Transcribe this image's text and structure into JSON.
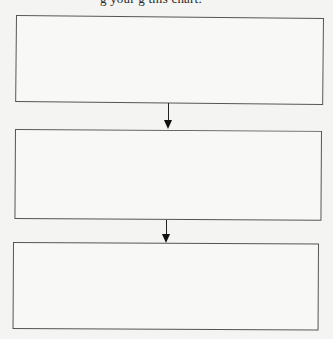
{
  "caption": {
    "text": "g your     g     this chart."
  },
  "flowchart": {
    "direction": "top-to-bottom",
    "boxes": [
      {
        "id": "step-1",
        "text": ""
      },
      {
        "id": "step-2",
        "text": ""
      },
      {
        "id": "step-3",
        "text": ""
      }
    ],
    "arrows": [
      {
        "from": "step-1",
        "to": "step-2"
      },
      {
        "from": "step-2",
        "to": "step-3"
      }
    ]
  },
  "colors": {
    "background": "#f4f4f2",
    "border": "#555555",
    "arrow": "#111111"
  }
}
